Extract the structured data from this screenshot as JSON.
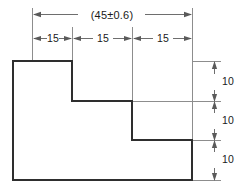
{
  "drawing": {
    "type": "engineering-dimensioned-profile",
    "title": "Stepped profile with overall and incremental dimensions",
    "units_implied": "mm",
    "overall": {
      "label": "(45±0.6)",
      "nominal": 45,
      "tolerance": "±0.6",
      "reference": true
    },
    "horizontal_dimensions": [
      {
        "label": "15",
        "value": 15
      },
      {
        "label": "15",
        "value": 15
      },
      {
        "label": "15",
        "value": 15
      }
    ],
    "vertical_dimensions": [
      {
        "label": "10",
        "value": 10
      },
      {
        "label": "10",
        "value": 10
      },
      {
        "label": "10",
        "value": 10
      }
    ],
    "colors": {
      "background": "#ffffff",
      "outline": "#2e2e2e",
      "extension_line": "#8d8d8d",
      "dimension_line": "#6e6e6e",
      "text": "#1a1a1a"
    },
    "profile_path": "M13,61 L72,61 L72,101 L132,101 L132,140 L192,140 L192,180 L13,180 Z"
  }
}
